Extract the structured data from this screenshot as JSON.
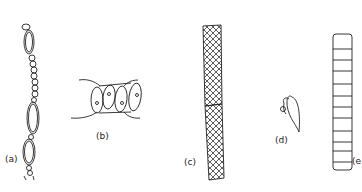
{
  "figure": {
    "panels": [
      {
        "id": "a",
        "label": "(a)",
        "description": "beaded filament chain of oval and small spherical cells"
      },
      {
        "id": "b",
        "label": "(b)",
        "description": "row of four cells with nuclei between connecting strands"
      },
      {
        "id": "c",
        "label": "(c)",
        "description": "cross-hatched elongated cell with spiral thickenings"
      },
      {
        "id": "d",
        "label": "(d)",
        "description": "leaf-like cell with hooked appendage"
      },
      {
        "id": "e",
        "label": "(e",
        "description": "segmented column of stacked cells"
      }
    ],
    "colors": {
      "ink": "#222222",
      "background": "#ffffff"
    }
  }
}
